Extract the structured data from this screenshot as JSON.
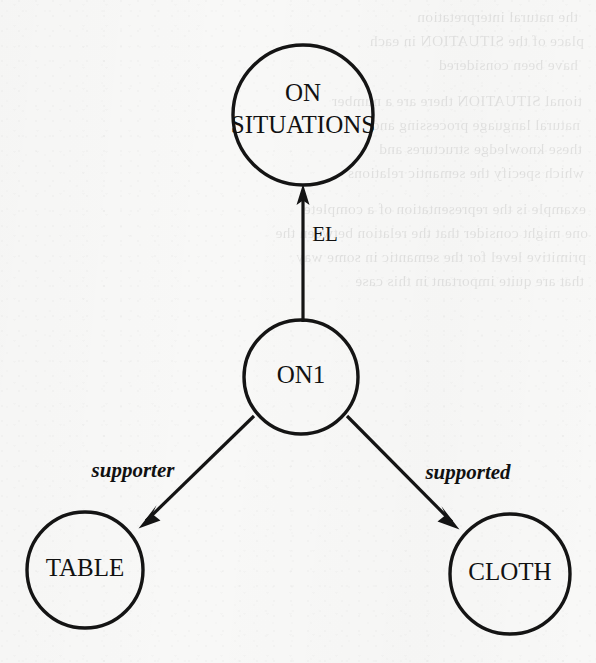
{
  "document": {
    "kind": "scanned-figure",
    "figure_type": "semantic-network-diagram",
    "background_color": "#f8f8f7",
    "ink_color": "#141414"
  },
  "diagram": {
    "title": "",
    "nodes": [
      {
        "id": "on-situations",
        "label_line1": "ON",
        "label_line2": "SITUATIONS",
        "label_full": "ON SITUATIONS",
        "cx": 303,
        "cy": 115,
        "r": 70,
        "font_size": 25
      },
      {
        "id": "on1",
        "label_line1": "ON1",
        "label_line2": "",
        "label_full": "ON1",
        "cx": 301,
        "cy": 377,
        "r": 57,
        "font_size": 25
      },
      {
        "id": "table",
        "label_line1": "TABLE",
        "label_line2": "",
        "label_full": "TABLE",
        "cx": 85,
        "cy": 570,
        "r": 58,
        "font_size": 25
      },
      {
        "id": "cloth",
        "label_line1": "CLOTH",
        "label_line2": "",
        "label_full": "CLOTH",
        "cx": 510,
        "cy": 574,
        "r": 60,
        "font_size": 25
      }
    ],
    "edges": [
      {
        "id": "edge-el",
        "from": "on1",
        "to": "on-situations",
        "label": "EL",
        "label_style": "upright",
        "label_x": 325,
        "label_y": 236,
        "font_size": 21,
        "x1": 303,
        "y1": 320,
        "x2": 303,
        "y2": 186
      },
      {
        "id": "edge-supporter",
        "from": "on1",
        "to": "table",
        "label": "supporter",
        "label_style": "italic",
        "label_x": 133,
        "label_y": 472,
        "font_size": 21,
        "x1": 254,
        "y1": 416,
        "x2": 139,
        "y2": 528
      },
      {
        "id": "edge-supported",
        "from": "on1",
        "to": "cloth",
        "label": "supported",
        "label_style": "italic",
        "label_x": 468,
        "label_y": 474,
        "font_size": 21,
        "x1": 347,
        "y1": 416,
        "x2": 459,
        "y2": 529
      }
    ]
  },
  "showthrough": {
    "note": "faint mirrored bleed-through text from reverse of page",
    "lines": [
      {
        "text": "the natural interpretation",
        "x": 18,
        "y": 8
      },
      {
        "text": "place of the SITUATION in each",
        "x": 12,
        "y": 32
      },
      {
        "text": "have been considered",
        "x": 18,
        "y": 56
      },
      {
        "text": "tional SITUATION there are a number",
        "x": 14,
        "y": 92
      },
      {
        "text": "natural language processing and",
        "x": 16,
        "y": 116
      },
      {
        "text": "these knowledge structures and",
        "x": 14,
        "y": 140
      },
      {
        "text": "which specify the semantic relations",
        "x": 12,
        "y": 164
      },
      {
        "text": "example is the representation of a complete",
        "x": 10,
        "y": 200
      },
      {
        "text": "one might consider that the relation between the",
        "x": 8,
        "y": 224
      },
      {
        "text": "primitive level for the semantic in some way",
        "x": 10,
        "y": 248
      },
      {
        "text": "that are quite important in this case",
        "x": 12,
        "y": 272
      }
    ]
  }
}
